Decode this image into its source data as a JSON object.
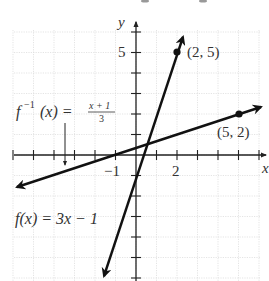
{
  "diagram": {
    "axes": {
      "x_label": "x",
      "y_label": "y",
      "tick_labels": {
        "x": [
          {
            "value": -1,
            "label": "−1"
          },
          {
            "value": 2,
            "label": "2"
          }
        ],
        "y": [
          {
            "value": 5,
            "label": "5"
          }
        ]
      },
      "x_range": [
        -6,
        6
      ],
      "y_range": [
        -6,
        6
      ],
      "grid": true
    },
    "functions": [
      {
        "name": "f",
        "label_prefix": "f(x) = 3x − 1",
        "expression": "3x - 1",
        "point": {
          "x": 2,
          "y": 5,
          "label": "(2, 5)"
        },
        "color": "#111111"
      },
      {
        "name": "f_inverse",
        "label_lhs": "f",
        "label_sup": "−1",
        "label_arg": "(x) =",
        "label_num": "x + 1",
        "label_den": "3",
        "expression": "(x + 1)/3",
        "point": {
          "x": 5,
          "y": 2,
          "label": "(5, 2)"
        },
        "color": "#111111"
      }
    ]
  }
}
